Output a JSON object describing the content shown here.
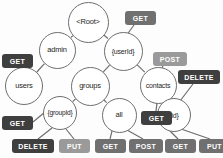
{
  "diagram": {
    "background": "#fdfdfd",
    "node_stroke": "#6e6e6e",
    "node_fill": "#ffffff",
    "node_text_color": "#262626",
    "edge_color": "#6e6e6e",
    "badge_colors": {
      "dark": "#3f3f3f",
      "medium": "#707070",
      "light": "#9a9a9a"
    },
    "nodes": [
      {
        "id": "root",
        "label": "<Root>",
        "cx": 88,
        "cy": 22,
        "r": 20.5,
        "font": 7.5
      },
      {
        "id": "admin",
        "label": "admin",
        "cx": 57,
        "cy": 50,
        "r": 18.5,
        "font": 7.5
      },
      {
        "id": "userid",
        "label": "{userId}",
        "cx": 123,
        "cy": 51,
        "r": 19.5,
        "font": 7.0
      },
      {
        "id": "users",
        "label": "users",
        "cx": 24,
        "cy": 86,
        "r": 19.0,
        "font": 7.5
      },
      {
        "id": "groups",
        "label": "groups",
        "cx": 90,
        "cy": 86,
        "r": 19.5,
        "font": 7.5
      },
      {
        "id": "contacts",
        "label": "contacts",
        "cx": 158,
        "cy": 85,
        "r": 18.5,
        "font": 7.0
      },
      {
        "id": "groupid",
        "label": "{groupId}",
        "cx": 60,
        "cy": 113,
        "r": 17.0,
        "font": 6.6
      },
      {
        "id": "all",
        "label": "all",
        "cx": 119,
        "cy": 115,
        "r": 17.5,
        "font": 7.5
      },
      {
        "id": "id",
        "label": "{id}",
        "cx": 174,
        "cy": 115,
        "r": 17.0,
        "font": 7.0
      }
    ],
    "edges": [
      {
        "from": "root",
        "to": "admin"
      },
      {
        "from": "root",
        "to": "userid"
      },
      {
        "from": "admin",
        "to": "users"
      },
      {
        "from": "userid",
        "to": "groups"
      },
      {
        "from": "userid",
        "to": "contacts"
      },
      {
        "from": "groups",
        "to": "groupid"
      },
      {
        "from": "groups",
        "to": "all"
      },
      {
        "from": "contacts",
        "to": "id"
      }
    ],
    "badges": [
      {
        "id": "get-admin",
        "label": "GET",
        "tone": "dark",
        "x": 2,
        "y": 54,
        "w": 31,
        "h": 14,
        "font": 7.0,
        "anchor_node": "users",
        "line": [
          18,
          68,
          24,
          79
        ]
      },
      {
        "id": "get-root",
        "label": "GET",
        "tone": "medium",
        "x": 125,
        "y": 11,
        "w": 31,
        "h": 14,
        "font": 7.0,
        "anchor_node": "userid",
        "line": [
          134,
          25,
          126,
          36
        ]
      },
      {
        "id": "post-contacts",
        "label": "POST",
        "tone": "light",
        "x": 153,
        "y": 52,
        "w": 34,
        "h": 14,
        "font": 7.0,
        "anchor_node": "contacts",
        "line": [
          163,
          66,
          162,
          68
        ]
      },
      {
        "id": "delete-id",
        "label": "DELETE",
        "tone": "dark",
        "x": 178,
        "y": 70,
        "w": 42,
        "h": 14,
        "font": 7.0,
        "anchor_node": "id",
        "line": [
          193,
          84,
          180,
          101
        ]
      },
      {
        "id": "get-contacts",
        "label": "GET",
        "tone": "dark",
        "x": 141,
        "y": 111,
        "w": 31,
        "h": 14,
        "font": 7.0,
        "anchor_node": "contacts",
        "line": [
          156,
          111,
          157,
          103
        ]
      },
      {
        "id": "get-groupid",
        "label": "GET",
        "tone": "dark",
        "x": 2,
        "y": 116,
        "w": 31,
        "h": 14,
        "font": 7.0,
        "anchor_node": "groupid",
        "line": [
          33,
          122,
          45,
          112
        ]
      },
      {
        "id": "delete-groupid",
        "label": "DELETE",
        "tone": "dark",
        "x": 12,
        "y": 139,
        "w": 42,
        "h": 14,
        "font": 7.0,
        "anchor_node": "groupid",
        "line": [
          38,
          139,
          52,
          128
        ]
      },
      {
        "id": "put-groupid",
        "label": "PUT",
        "tone": "light",
        "x": 59,
        "y": 139,
        "w": 31,
        "h": 14,
        "font": 7.0,
        "anchor_node": "groupid",
        "line": [
          74,
          139,
          66,
          129
        ]
      },
      {
        "id": "get-all",
        "label": "GET",
        "tone": "medium",
        "x": 95,
        "y": 139,
        "w": 31,
        "h": 14,
        "font": 7.0,
        "anchor_node": "all",
        "line": [
          110,
          139,
          112,
          131
        ]
      },
      {
        "id": "post-all",
        "label": "POST",
        "tone": "medium",
        "x": 129,
        "y": 139,
        "w": 34,
        "h": 14,
        "font": 7.0,
        "anchor_node": "all",
        "line": [
          143,
          139,
          127,
          130
        ]
      },
      {
        "id": "get-id",
        "label": "GET",
        "tone": "medium",
        "x": 165,
        "y": 139,
        "w": 31,
        "h": 14,
        "font": 7.0,
        "anchor_node": "id",
        "line": [
          178,
          139,
          170,
          131
        ]
      },
      {
        "id": "put-id",
        "label": "PUT",
        "tone": "medium",
        "x": 199,
        "y": 139,
        "w": 31,
        "h": 14,
        "font": 7.0,
        "anchor_node": "id",
        "line": [
          210,
          139,
          181,
          129
        ]
      }
    ]
  }
}
